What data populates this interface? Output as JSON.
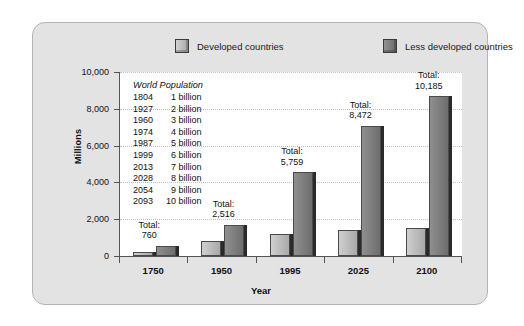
{
  "chart_data": {
    "type": "bar",
    "title": "",
    "subtitle": "",
    "xlabel": "Year",
    "ylabel": "Millions",
    "categories": [
      "1750",
      "1950",
      "1995",
      "2025",
      "2100"
    ],
    "series": [
      {
        "name": "Developed countries",
        "color": "#bfbfbf",
        "values": [
          200,
          812,
          1220,
          1400,
          1500
        ]
      },
      {
        "name": "Less developed countries",
        "color": "#7d7d7d",
        "values": [
          560,
          1704,
          4539,
          7072,
          8685
        ]
      }
    ],
    "annotations": {
      "total_prefix": "Total:",
      "totals": [
        "760",
        "2,516",
        "5,759",
        "8,472",
        "10,185"
      ]
    },
    "ylim": [
      0,
      10000
    ],
    "yticks": [
      0,
      2000,
      4000,
      6000,
      8000,
      10000
    ],
    "ytick_labels": [
      "0",
      "2,000",
      "4,000",
      "6,000",
      "8,000",
      "10,000"
    ],
    "grid": true,
    "legend_position": "top"
  },
  "legend": {
    "items": [
      {
        "label": "Developed countries",
        "swatch": "light-gray-swatch"
      },
      {
        "label": "Less developed countries",
        "swatch": "dark-gray-swatch"
      }
    ]
  },
  "world_population": {
    "title": "World Population",
    "rows": [
      {
        "year": "1804",
        "amount": "1 billion"
      },
      {
        "year": "1927",
        "amount": "2 billion"
      },
      {
        "year": "1960",
        "amount": "3 billion"
      },
      {
        "year": "1974",
        "amount": "4 billion"
      },
      {
        "year": "1987",
        "amount": "5 billion"
      },
      {
        "year": "1999",
        "amount": "6 billion"
      },
      {
        "year": "2013",
        "amount": "7 billion"
      },
      {
        "year": "2028",
        "amount": "8 billion"
      },
      {
        "year": "2054",
        "amount": "9 billion"
      },
      {
        "year": "2093",
        "amount": "10 billion"
      }
    ]
  },
  "colors": {
    "panel_background": "#e3e3e3",
    "plot_background": "#ffffff",
    "axis": "#555555",
    "gridline": "#c2c2c2",
    "developed_bar": "#bfbfbf",
    "less_developed_bar": "#7d7d7d",
    "text": "#111111"
  }
}
